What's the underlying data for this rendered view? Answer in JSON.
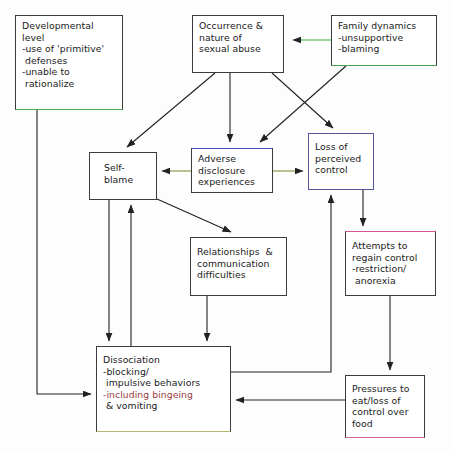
{
  "diagram": {
    "type": "flow-diagram",
    "canvas": {
      "width": 452,
      "height": 451,
      "background": "#fdfdfd"
    },
    "colors": {
      "box_border": "#3b3b3b",
      "text": "#1a1a1a",
      "accent_green": "#49a349",
      "accent_blue": "#55559c",
      "accent_pink": "#d4558f",
      "accent_olive": "#b5b56b",
      "highlight_text_red": "#9c3b42",
      "arrow_black": "#222222"
    },
    "nodes": [
      {
        "id": "developmental-level",
        "lines": [
          "Developmental",
          "level",
          "-use of 'primitive'",
          " defenses",
          "-unable to",
          " rationalize"
        ],
        "x": 15,
        "y": 15,
        "w": 108,
        "h": 95,
        "accent": "acc-green-bottom"
      },
      {
        "id": "occurrence-sexual-abuse",
        "lines": [
          "Occurrence &",
          "nature of",
          "sexual abuse"
        ],
        "x": 192,
        "y": 15,
        "w": 92,
        "h": 58,
        "accent": ""
      },
      {
        "id": "family-dynamics",
        "lines": [
          "Family dynamics",
          "-unsupportive",
          "-blaming"
        ],
        "x": 331,
        "y": 15,
        "w": 106,
        "h": 51,
        "accent": "acc-green-box"
      },
      {
        "id": "self-blame",
        "lines": [
          "Self-",
          "blame"
        ],
        "x": 89,
        "y": 152,
        "w": 68,
        "h": 48,
        "accent": ""
      },
      {
        "id": "adverse-disclosure",
        "lines": [
          "Adverse",
          "disclosure",
          "experiences"
        ],
        "x": 191,
        "y": 148,
        "w": 82,
        "h": 45,
        "accent": "acc-blue-top"
      },
      {
        "id": "loss-of-perceived-control",
        "lines": [
          "Loss of",
          "perceived",
          "control"
        ],
        "x": 308,
        "y": 133,
        "w": 66,
        "h": 57,
        "accent": "acc-blue-box"
      },
      {
        "id": "relationships-communication",
        "lines": [
          "Relationships  &",
          "communication",
          "difficulties"
        ],
        "x": 190,
        "y": 237,
        "w": 97,
        "h": 59,
        "accent": ""
      },
      {
        "id": "attempts-regain-control",
        "lines": [
          "Attempts to",
          "regain control",
          "-restriction/",
          " anorexia"
        ],
        "x": 345,
        "y": 231,
        "w": 91,
        "h": 65,
        "accent": "acc-pink-top"
      },
      {
        "id": "dissociation",
        "lines": [
          "Dissociation",
          "-blocking/",
          " impulsive behaviors",
          "-including bingeing",
          " & vomiting"
        ],
        "x": 96,
        "y": 346,
        "w": 135,
        "h": 86,
        "accent": "acc-olive-bottom",
        "red_line_index": 3
      },
      {
        "id": "pressures-to-eat",
        "lines": [
          "Pressures to",
          "eat/loss of",
          "control over",
          "food"
        ],
        "x": 345,
        "y": 375,
        "w": 80,
        "h": 63,
        "accent": "acc-pink-bottom"
      }
    ],
    "edges": [
      {
        "id": "family-to-occurrence",
        "from": "family-dynamics",
        "to": "occurrence-sexual-abuse",
        "color": "#3faa3f",
        "style": "straight"
      },
      {
        "id": "occurrence-to-self-blame",
        "from": "occurrence-sexual-abuse",
        "to": "self-blame",
        "color": "#222222",
        "style": "diagonal"
      },
      {
        "id": "occurrence-to-adverse-disclosure",
        "from": "occurrence-sexual-abuse",
        "to": "adverse-disclosure",
        "color": "#222222",
        "style": "straight"
      },
      {
        "id": "occurrence-to-loss-of-control",
        "from": "occurrence-sexual-abuse",
        "to": "loss-of-perceived-control",
        "color": "#222222",
        "style": "diagonal"
      },
      {
        "id": "family-to-adverse-disclosure",
        "from": "family-dynamics",
        "to": "adverse-disclosure",
        "color": "#222222",
        "style": "diagonal"
      },
      {
        "id": "adverse-disclosure-to-self-blame",
        "from": "adverse-disclosure",
        "to": "self-blame",
        "color": "#8c8c3e",
        "style": "straight"
      },
      {
        "id": "adverse-disclosure-to-loss-of-control",
        "from": "adverse-disclosure",
        "to": "loss-of-perceived-control",
        "color": "#8c8c3e",
        "style": "straight"
      },
      {
        "id": "self-blame-to-relationships",
        "from": "self-blame",
        "to": "relationships-communication",
        "color": "#222222",
        "style": "diagonal"
      },
      {
        "id": "self-blame-to-dissociation",
        "from": "self-blame",
        "to": "dissociation",
        "color": "#222222",
        "style": "straight"
      },
      {
        "id": "dissociation-to-self-blame",
        "from": "dissociation",
        "to": "self-blame",
        "color": "#222222",
        "style": "straight"
      },
      {
        "id": "relationships-to-dissociation",
        "from": "relationships-communication",
        "to": "dissociation",
        "color": "#222222",
        "style": "straight"
      },
      {
        "id": "developmental-to-dissociation",
        "from": "developmental-level",
        "to": "dissociation",
        "color": "#222222",
        "style": "elbow"
      },
      {
        "id": "loss-of-control-to-attempts",
        "from": "loss-of-perceived-control",
        "to": "attempts-regain-control",
        "color": "#222222",
        "style": "straight"
      },
      {
        "id": "attempts-to-pressures",
        "from": "attempts-regain-control",
        "to": "pressures-to-eat",
        "color": "#222222",
        "style": "straight"
      },
      {
        "id": "pressures-to-dissociation",
        "from": "pressures-to-eat",
        "to": "dissociation",
        "color": "#222222",
        "style": "straight"
      },
      {
        "id": "dissociation-to-loss-of-control",
        "from": "dissociation",
        "to": "loss-of-perceived-control",
        "color": "#222222",
        "style": "elbow"
      }
    ]
  }
}
